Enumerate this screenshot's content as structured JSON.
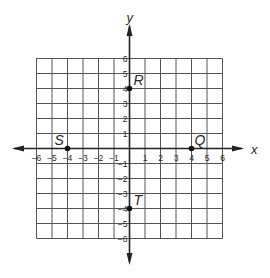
{
  "figure": {
    "x_axis_label": "x",
    "y_axis_label": "y",
    "x_range": [
      -6,
      6
    ],
    "y_range": [
      -6,
      6
    ],
    "grid": true,
    "x_ticks": [
      "-6",
      "-5",
      "-4",
      "-3",
      "-2",
      "-1",
      "1",
      "2",
      "3",
      "4",
      "5",
      "6"
    ],
    "y_ticks": [
      "6",
      "5",
      "4",
      "3",
      "2",
      "1",
      "-1",
      "-2",
      "-3",
      "-4",
      "-5",
      "-6"
    ],
    "points": [
      {
        "label": "R",
        "x": 0,
        "y": 4
      },
      {
        "label": "S",
        "x": -4,
        "y": 0
      },
      {
        "label": "Q",
        "x": 4,
        "y": 0
      },
      {
        "label": "T",
        "x": 0,
        "y": -4
      }
    ],
    "colors": {
      "grid": "#555555",
      "axes": "#222222",
      "points": "#111111"
    }
  },
  "chart_data": {
    "type": "scatter",
    "title": "",
    "xlabel": "x",
    "ylabel": "y",
    "xlim": [
      -6,
      6
    ],
    "ylim": [
      -6,
      6
    ],
    "grid": true,
    "series": [
      {
        "name": "points",
        "labels": [
          "R",
          "S",
          "Q",
          "T"
        ],
        "x": [
          0,
          -4,
          4,
          0
        ],
        "y": [
          4,
          0,
          0,
          -4
        ]
      }
    ]
  }
}
